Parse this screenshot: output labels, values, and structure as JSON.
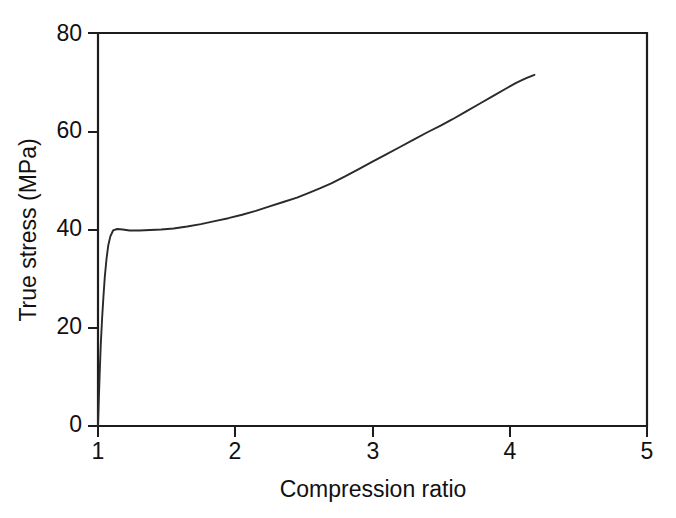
{
  "figure": {
    "background_color": "#ffffff",
    "line_color": "#2a2a2a",
    "axis_color": "#1d1d1d"
  },
  "chart_data": {
    "type": "line",
    "title": "",
    "subtitle": "",
    "xlabel": "Compression ratio",
    "ylabel": "True stress (MPa)",
    "xlim": [
      1,
      5
    ],
    "ylim": [
      0,
      80
    ],
    "xticks": [
      1,
      2,
      3,
      4,
      5
    ],
    "yticks": [
      0,
      20,
      40,
      60,
      80
    ],
    "xticklabels": [
      "1",
      "2",
      "3",
      "4",
      "5"
    ],
    "yticklabels": [
      "0",
      "20",
      "40",
      "60",
      "80"
    ],
    "grid": false,
    "legend": null,
    "legend_position": "none",
    "annotations": [],
    "series": [
      {
        "name": "True stress vs compression ratio",
        "x": [
          1.0,
          1.005,
          1.012,
          1.02,
          1.03,
          1.04,
          1.05,
          1.062,
          1.075,
          1.09,
          1.11,
          1.14,
          1.18,
          1.23,
          1.3,
          1.38,
          1.46,
          1.55,
          1.65,
          1.75,
          1.85,
          1.95,
          2.05,
          2.15,
          2.25,
          2.35,
          2.45,
          2.55,
          2.62,
          2.7,
          2.8,
          2.9,
          3.0,
          3.1,
          3.2,
          3.3,
          3.4,
          3.5,
          3.58,
          3.68,
          3.78,
          3.88,
          3.98,
          4.05,
          4.12,
          4.18
        ],
        "y": [
          0.0,
          4.5,
          10.5,
          16.5,
          22.0,
          26.5,
          30.5,
          34.0,
          36.8,
          38.6,
          39.8,
          40.1,
          40.0,
          39.8,
          39.8,
          39.9,
          40.0,
          40.2,
          40.6,
          41.1,
          41.7,
          42.3,
          43.0,
          43.8,
          44.7,
          45.6,
          46.5,
          47.6,
          48.4,
          49.4,
          50.8,
          52.3,
          53.8,
          55.3,
          56.8,
          58.3,
          59.8,
          61.2,
          62.4,
          64.0,
          65.6,
          67.2,
          68.8,
          69.9,
          70.8,
          71.5
        ]
      }
    ]
  }
}
